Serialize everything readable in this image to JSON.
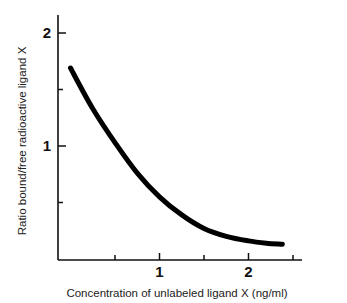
{
  "chart_data": {
    "type": "line",
    "title": "",
    "xlabel": "Concentration of unlabeled ligand X (ng/ml)",
    "ylabel": "Ratio bound/free radioactive ligand X",
    "xlim": [
      -0.15,
      2.6
    ],
    "ylim": [
      0,
      2.2
    ],
    "x_ticks": [
      {
        "value": 0.5,
        "label": ""
      },
      {
        "value": 1,
        "label": "1"
      },
      {
        "value": 1.5,
        "label": ""
      },
      {
        "value": 2,
        "label": "2"
      },
      {
        "value": 2.5,
        "label": ""
      }
    ],
    "y_ticks": [
      {
        "value": 0.5,
        "label": ""
      },
      {
        "value": 1,
        "label": "1"
      },
      {
        "value": 1.5,
        "label": ""
      },
      {
        "value": 2,
        "label": "2"
      }
    ],
    "grid": false,
    "legend": null,
    "series": [
      {
        "name": "Displacement curve",
        "color": "#000000",
        "x": [
          0.0,
          0.25,
          0.5,
          0.75,
          1.0,
          1.25,
          1.5,
          1.75,
          2.0,
          2.2,
          2.38
        ],
        "y": [
          1.69,
          1.33,
          1.03,
          0.76,
          0.55,
          0.39,
          0.27,
          0.2,
          0.16,
          0.14,
          0.13
        ]
      }
    ]
  }
}
